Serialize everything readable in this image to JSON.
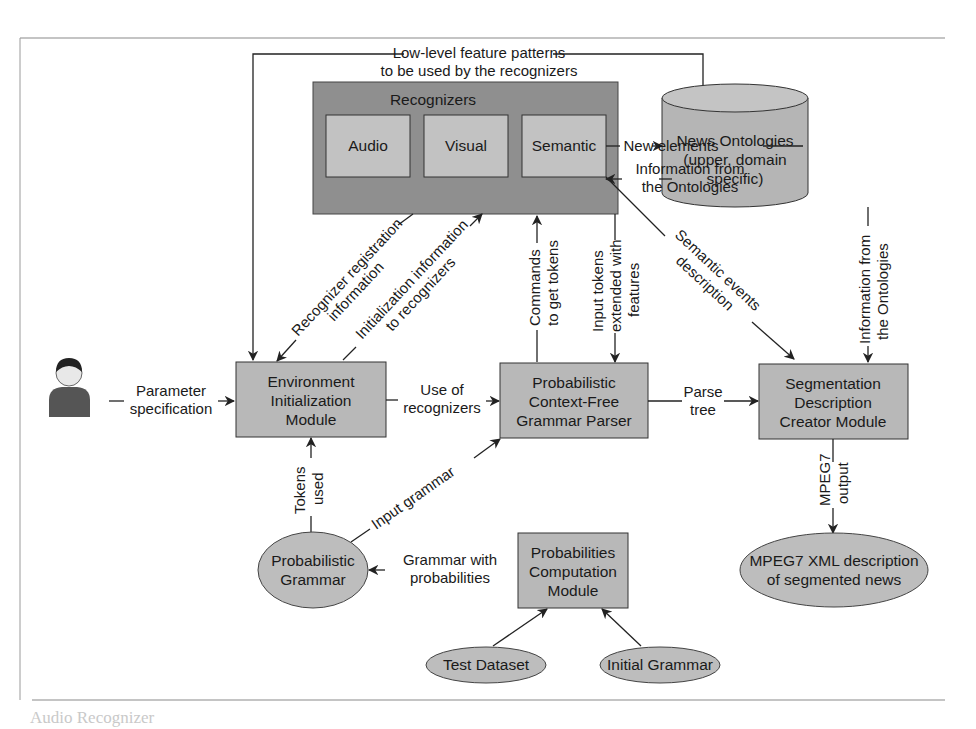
{
  "colors": {
    "box_fill": "#b8b8b8",
    "inner_box_fill": "#c2c2c2",
    "container_fill": "#8f8f8f",
    "ellipse_fill": "#bdbdbd",
    "line": "#222222",
    "frame": "#9a9a9a"
  },
  "recognizers": {
    "title": "Recognizers",
    "items": [
      {
        "label": "Audio"
      },
      {
        "label": "Visual"
      },
      {
        "label": "Semantic"
      }
    ]
  },
  "ontology": {
    "lines": [
      "News Ontologies",
      "(upper, domain",
      "specific)"
    ]
  },
  "modules": {
    "env_init": {
      "lines": [
        "Environment",
        "Initialization",
        "Module"
      ]
    },
    "parser": {
      "lines": [
        "Probabilistic",
        "Context-Free",
        "Grammar Parser"
      ]
    },
    "segmentation": {
      "lines": [
        "Segmentation",
        "Description",
        "Creator Module"
      ]
    },
    "prob_comp": {
      "lines": [
        "Probabilities",
        "Computation",
        "Module"
      ]
    }
  },
  "ellipses": {
    "prob_grammar": {
      "lines": [
        "Probabilistic",
        "Grammar"
      ]
    },
    "mpeg7_xml": {
      "lines": [
        "MPEG7 XML description",
        "of segmented news"
      ]
    },
    "test_dataset": {
      "label": "Test Dataset"
    },
    "initial_grammar": {
      "label": "Initial Grammar"
    }
  },
  "actor": {
    "icon": "user-icon"
  },
  "edges": {
    "low_level": [
      "Low-level feature patterns",
      "to be used by the recognizers"
    ],
    "new_elements": "New elements",
    "info_from_ontologies_h": [
      "Information from",
      "the Ontologies"
    ],
    "recognizer_registration": [
      "Recognizer registration",
      "information"
    ],
    "initialization_info": [
      "Initialization information",
      "to recognizers"
    ],
    "commands": [
      "Commands",
      "to get tokens"
    ],
    "input_tokens": [
      "Input tokens",
      "extended with",
      "features"
    ],
    "semantic_events": [
      "Semantic events",
      "description"
    ],
    "info_from_ontologies_v": [
      "Information from",
      "the Ontologies"
    ],
    "parameter_spec": [
      "Parameter",
      "specification"
    ],
    "use_of_recognizers": [
      "Use of",
      "recognizers"
    ],
    "parse_tree": [
      "Parse",
      "tree"
    ],
    "tokens_used": [
      "Tokens",
      "used"
    ],
    "input_grammar": "Input grammar",
    "mpeg7_output": [
      "MPEG7",
      "output"
    ],
    "grammar_with_prob": [
      "Grammar with",
      "probabilities"
    ]
  },
  "page_fragments": {
    "section_heading": "Audio Recognizer"
  }
}
